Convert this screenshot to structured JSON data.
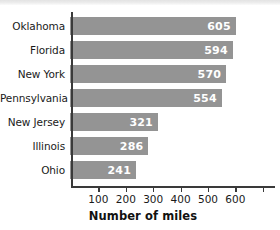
{
  "chart_data": {
    "type": "bar",
    "orientation": "horizontal",
    "title": "",
    "xlabel": "Number of miles",
    "ylabel": "",
    "categories": [
      "Oklahoma",
      "Florida",
      "New York",
      "Pennsylvania",
      "New Jersey",
      "Illinois",
      "Ohio"
    ],
    "values": [
      605,
      594,
      570,
      554,
      321,
      286,
      241
    ],
    "value_labels": [
      "605",
      "594",
      "570",
      "554",
      "321",
      "286",
      "241"
    ],
    "xlim": [
      0,
      740
    ],
    "xticks": [
      100,
      200,
      300,
      400,
      500,
      600
    ],
    "xtick_labels": [
      "100",
      "200",
      "300",
      "400",
      "500",
      "600"
    ],
    "grid": false,
    "legend": false,
    "bar_color": "#949494",
    "value_label_color": "#ffffff",
    "axis_color": "#3a3a3a",
    "text_color": "#1a1a1a"
  }
}
